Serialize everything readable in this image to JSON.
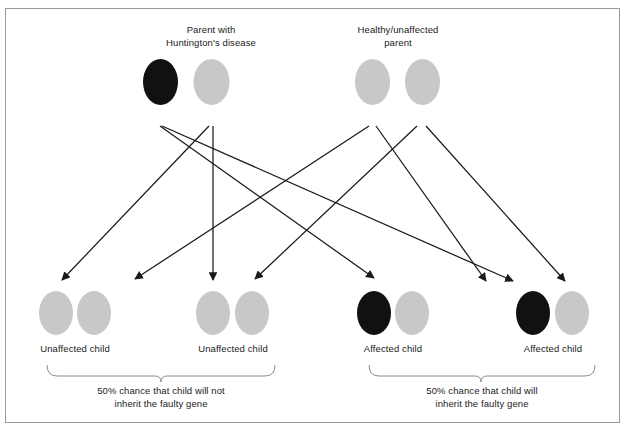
{
  "figure": {
    "type": "inheritance-pedigree-diagram",
    "title_visible": false,
    "frame": {
      "border_color": "#9a9a9a",
      "background": "#ffffff"
    }
  },
  "colors": {
    "affected_allele": "#111111",
    "normal_allele": "#c8c8c8",
    "line": "#1a1a1a",
    "bracket": "#8c8c8c",
    "text": "#1a1a1a"
  },
  "parents": [
    {
      "id": "parent-affected",
      "label": "Parent with\nHuntington's disease",
      "alleles": [
        {
          "name": "allele-faulty",
          "state": "affected",
          "fill": "#111111"
        },
        {
          "name": "allele-normal",
          "state": "normal",
          "fill": "#c8c8c8"
        }
      ]
    },
    {
      "id": "parent-healthy",
      "label": "Healthy/unaffected\nparent",
      "alleles": [
        {
          "name": "allele-normal-1",
          "state": "normal",
          "fill": "#c8c8c8"
        },
        {
          "name": "allele-normal-2",
          "state": "normal",
          "fill": "#c8c8c8"
        }
      ]
    }
  ],
  "children": [
    {
      "id": "child-1",
      "label": "Unaffected child",
      "alleles": [
        {
          "name": "allele-normal",
          "state": "normal",
          "fill": "#c8c8c8"
        },
        {
          "name": "allele-normal",
          "state": "normal",
          "fill": "#c8c8c8"
        }
      ]
    },
    {
      "id": "child-2",
      "label": "Unaffected child",
      "alleles": [
        {
          "name": "allele-normal",
          "state": "normal",
          "fill": "#c8c8c8"
        },
        {
          "name": "allele-normal",
          "state": "normal",
          "fill": "#c8c8c8"
        }
      ]
    },
    {
      "id": "child-3",
      "label": "Affected child",
      "alleles": [
        {
          "name": "allele-faulty",
          "state": "affected",
          "fill": "#111111"
        },
        {
          "name": "allele-normal",
          "state": "normal",
          "fill": "#c8c8c8"
        }
      ]
    },
    {
      "id": "child-4",
      "label": "Affected child",
      "alleles": [
        {
          "name": "allele-faulty",
          "state": "affected",
          "fill": "#111111"
        },
        {
          "name": "allele-normal",
          "state": "normal",
          "fill": "#c8c8c8"
        }
      ]
    }
  ],
  "brackets": [
    {
      "id": "bracket-unaffected",
      "caption": "50% chance that child will not\ninherit the faulty gene",
      "percent": "50%",
      "covers": [
        "child-1",
        "child-2"
      ]
    },
    {
      "id": "bracket-affected",
      "caption": "50% chance that child will\ninherit the faulty gene",
      "percent": "50%",
      "covers": [
        "child-3",
        "child-4"
      ]
    }
  ]
}
